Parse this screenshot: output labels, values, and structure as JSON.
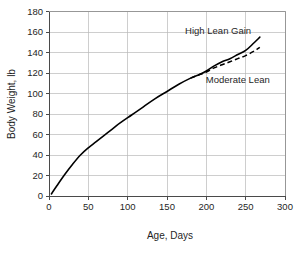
{
  "chart_data": {
    "type": "line",
    "title": "",
    "xlabel": "Age, Days",
    "ylabel": "Body Weight, lb",
    "xlim": [
      0,
      300
    ],
    "ylim": [
      0,
      180
    ],
    "xticks": [
      0,
      50,
      100,
      150,
      200,
      250,
      300
    ],
    "yticks": [
      0,
      20,
      40,
      60,
      80,
      100,
      120,
      140,
      160,
      180
    ],
    "xtick_labels": [
      "0",
      "50",
      "100",
      "150",
      "200",
      "250",
      "300"
    ],
    "ytick_labels": [
      "0",
      "20",
      "40",
      "60",
      "80",
      "100",
      "120",
      "140",
      "160",
      "180"
    ],
    "grid": true,
    "grid_color": "#b9b9b9",
    "legend_position": "inline-annotations",
    "series": [
      {
        "name": "High Lean Gain",
        "style": "solid",
        "color": "#000000",
        "x": [
          3,
          10,
          20,
          30,
          40,
          50,
          60,
          75,
          90,
          105,
          120,
          135,
          150,
          165,
          180,
          190,
          200,
          210,
          220,
          230,
          240,
          250,
          260,
          268
        ],
        "values": [
          2,
          10,
          21,
          31,
          40,
          47,
          53,
          62,
          71,
          79,
          87,
          95,
          102,
          109,
          115,
          118,
          122,
          127,
          131,
          134,
          138,
          142,
          149,
          155
        ]
      },
      {
        "name": "Moderate Lean",
        "style": "dashed",
        "color": "#000000",
        "x": [
          180,
          190,
          200,
          210,
          220,
          230,
          240,
          250,
          260,
          268
        ],
        "values": [
          115,
          118,
          121,
          125,
          128,
          131,
          134,
          137,
          141,
          145
        ]
      }
    ],
    "annotations": [
      {
        "text": "High Lean Gain",
        "x": 215,
        "y": 158,
        "anchor": "middle"
      },
      {
        "text": "Moderate Lean",
        "x": 240,
        "y": 110,
        "anchor": "middle"
      }
    ]
  }
}
